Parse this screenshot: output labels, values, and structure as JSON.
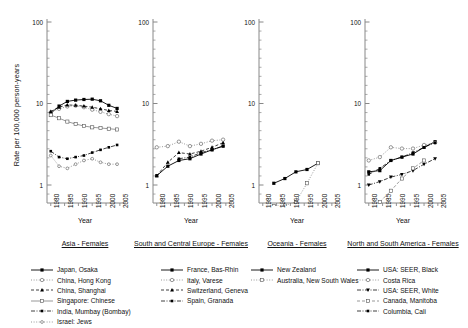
{
  "figure": {
    "ylabel": "Rate per 100,000 person-years",
    "xlabel": "Year",
    "ytick_labels": [
      "100",
      "10",
      "1"
    ],
    "xtick_labels": [
      "1980",
      "1985",
      "1990",
      "1995",
      "2000",
      "2005"
    ],
    "colors": {
      "axis": "#888888",
      "ink": "#000000",
      "open": "#777777"
    }
  },
  "panels": [
    {
      "title": "Asia - Females",
      "xaxis_title": "Year"
    },
    {
      "title": "South and Central Europe - Females",
      "xaxis_title": "Year"
    },
    {
      "title": "Oceania - Females",
      "xaxis_title": "Year"
    },
    {
      "title": "North and South America - Females",
      "xaxis_title": "Year"
    }
  ],
  "legend_columns": [
    {
      "entries": [
        {
          "label": "Japan, Osaka"
        },
        {
          "label": "China, Hong Kong"
        },
        {
          "label": "China, Shanghai"
        },
        {
          "label": "Singapore: Chinese"
        },
        {
          "label": "India, Mumbay (Bombay)"
        },
        {
          "label": "Israel: Jews"
        }
      ]
    },
    {
      "entries": [
        {
          "label": "France, Bas-Rhin"
        },
        {
          "label": "Italy, Varese"
        },
        {
          "label": "Switzerland, Geneva"
        },
        {
          "label": "Spain, Granada"
        }
      ]
    },
    {
      "entries": [
        {
          "label": "New Zealand"
        },
        {
          "label": "Australia, New South Wales"
        }
      ]
    },
    {
      "entries": [
        {
          "label": "USA: SEER, Black"
        },
        {
          "label": "Costa Rica"
        },
        {
          "label": "USA: SEER, White"
        },
        {
          "label": "Canada, Manitoba"
        },
        {
          "label": "Columbia, Cali"
        }
      ]
    }
  ],
  "chart_data": {
    "type": "line",
    "title": "",
    "xlabel": "Year",
    "ylabel": "Rate per 100,000 person-years",
    "yscale": "log",
    "ylim": [
      0.3,
      100
    ],
    "xlim": [
      1978,
      2007
    ],
    "ytick_values": [
      1,
      10,
      100
    ],
    "xtick_values": [
      1980,
      1985,
      1990,
      1995,
      2000,
      2005
    ],
    "grid": false,
    "legend_position": "below",
    "panels": [
      {
        "name": "Asia - Females",
        "series": [
          {
            "name": "Japan, Osaka",
            "marker": "filled-square",
            "line": "solid",
            "x": [
              1980,
              1983,
              1986,
              1989,
              1992,
              1995,
              1998,
              2001,
              2004
            ],
            "y": [
              7.6,
              9.3,
              10.6,
              11.0,
              11.2,
              11.3,
              10.8,
              9.5,
              8.7
            ]
          },
          {
            "name": "China, Hong Kong",
            "marker": "open-circle",
            "line": "dotted",
            "x": [
              1980,
              1983,
              1986,
              1989,
              1992,
              1995,
              1998,
              2001,
              2004
            ],
            "y": [
              7.8,
              8.6,
              9.2,
              9.4,
              9.0,
              8.4,
              7.9,
              7.4,
              7.0
            ]
          },
          {
            "name": "China, Shanghai",
            "marker": "filled-triangle",
            "line": "dashed",
            "x": [
              1980,
              1983,
              1986,
              1989,
              1992,
              1995,
              1998,
              2001,
              2004
            ],
            "y": [
              8.0,
              9.0,
              9.6,
              9.5,
              9.3,
              9.0,
              8.6,
              8.2,
              8.0
            ]
          },
          {
            "name": "Singapore: Chinese",
            "marker": "open-square",
            "line": "solid-thin",
            "x": [
              1980,
              1983,
              1986,
              1989,
              1992,
              1995,
              1998,
              2001,
              2004
            ],
            "y": [
              7.2,
              6.6,
              6.0,
              5.6,
              5.3,
              5.1,
              5.0,
              4.9,
              4.8
            ]
          },
          {
            "name": "India, Mumbay (Bombay)",
            "marker": "filled-square-small",
            "line": "dash-dot",
            "x": [
              1980,
              1983,
              1986,
              1989,
              1992,
              1995,
              1998,
              2001,
              2004
            ],
            "y": [
              2.6,
              2.2,
              2.1,
              2.2,
              2.3,
              2.5,
              2.7,
              2.9,
              3.1
            ]
          },
          {
            "name": "Israel: Jews",
            "marker": "open-circle-small",
            "line": "dotted",
            "x": [
              1980,
              1983,
              1986,
              1989,
              1992,
              1995,
              1998,
              2001,
              2004
            ],
            "y": [
              2.3,
              1.7,
              1.6,
              1.8,
              2.0,
              2.1,
              1.9,
              1.8,
              1.8
            ]
          }
        ]
      },
      {
        "name": "South and Central Europe - Females",
        "series": [
          {
            "name": "France, Bas-Rhin",
            "marker": "filled-square",
            "line": "solid",
            "x": [
              1980,
              1984,
              1988,
              1992,
              1996,
              2000,
              2004
            ],
            "y": [
              1.3,
              1.7,
              2.0,
              2.1,
              2.4,
              2.7,
              3.0
            ]
          },
          {
            "name": "Italy, Varese",
            "marker": "open-circle",
            "line": "dotted",
            "x": [
              1980,
              1984,
              1988,
              1992,
              1996,
              2000,
              2004
            ],
            "y": [
              2.9,
              3.0,
              3.4,
              3.0,
              3.2,
              3.5,
              3.6
            ]
          },
          {
            "name": "Switzerland, Geneva",
            "marker": "filled-triangle",
            "line": "dashed",
            "x": [
              1980,
              1984,
              1988,
              1992,
              1996,
              2000,
              2004
            ],
            "y": [
              1.3,
              1.9,
              2.5,
              2.4,
              2.6,
              2.9,
              3.3
            ]
          },
          {
            "name": "Spain, Granada",
            "marker": "filled-square-small",
            "line": "dash-dot",
            "x": [
              1988,
              1992,
              1996,
              2000,
              2004
            ],
            "y": [
              2.1,
              2.2,
              2.5,
              2.7,
              3.0
            ]
          }
        ]
      },
      {
        "name": "Oceania - Females",
        "series": [
          {
            "name": "New Zealand",
            "marker": "filled-square",
            "line": "solid",
            "x": [
              1984,
              1988,
              1992,
              1996,
              2000
            ],
            "y": [
              1.05,
              1.2,
              1.45,
              1.55,
              1.85
            ]
          },
          {
            "name": "Australia, New South Wales",
            "marker": "open-square",
            "line": "dotted",
            "x": [
              1980,
              1984,
              1988,
              1992,
              1996,
              2000
            ],
            "y": [
              0.38,
              0.55,
              0.56,
              0.62,
              1.05,
              1.85
            ]
          }
        ]
      },
      {
        "name": "North and South America - Females",
        "series": [
          {
            "name": "USA: SEER, Black",
            "marker": "filled-square",
            "line": "solid",
            "x": [
              1980,
              1984,
              1988,
              1992,
              1996,
              2000,
              2004
            ],
            "y": [
              1.45,
              1.5,
              2.0,
              2.2,
              2.4,
              2.9,
              3.4
            ]
          },
          {
            "name": "Costa Rica",
            "marker": "open-circle",
            "line": "dotted",
            "x": [
              1980,
              1984,
              1988,
              1992,
              1996,
              2000,
              2004
            ],
            "y": [
              2.0,
              2.2,
              2.9,
              2.8,
              2.8,
              3.1,
              3.3
            ]
          },
          {
            "name": "USA: SEER, White",
            "marker": "filled-triangle-down",
            "line": "dash-dot",
            "x": [
              1980,
              1984,
              1988,
              1992,
              1996,
              2000,
              2004
            ],
            "y": [
              1.0,
              1.1,
              1.25,
              1.35,
              1.5,
              1.8,
              2.1
            ]
          },
          {
            "name": "Canada, Manitoba",
            "marker": "open-square",
            "line": "dashed",
            "x": [
              1984,
              1988,
              1992,
              1996,
              2000
            ],
            "y": [
              0.62,
              0.85,
              1.2,
              1.6,
              2.0
            ]
          },
          {
            "name": "Columbia, Cali",
            "marker": "filled-square-small",
            "line": "dash-dot",
            "x": [
              1980,
              1984,
              1988,
              1992,
              1996,
              2000,
              2004
            ],
            "y": [
              1.35,
              1.6,
              2.0,
              2.2,
              2.5,
              2.9,
              3.3
            ]
          }
        ]
      }
    ]
  }
}
